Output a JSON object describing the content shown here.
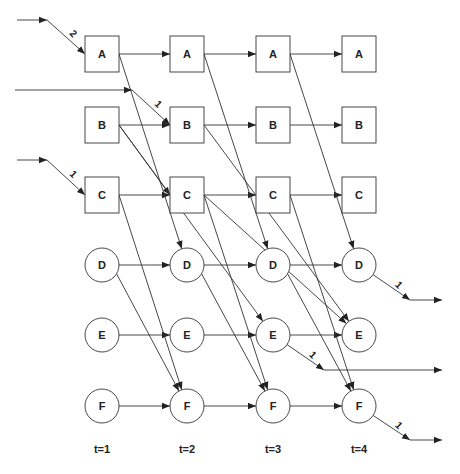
{
  "diagram": {
    "columns": [
      {
        "id": "t1",
        "label": "t=1",
        "x": 102
      },
      {
        "id": "t2",
        "label": "t=2",
        "x": 187
      },
      {
        "id": "t3",
        "label": "t=3",
        "x": 273
      },
      {
        "id": "t4",
        "label": "t=4",
        "x": 359
      }
    ],
    "rows": [
      {
        "id": "A",
        "label": "A",
        "shape": "square",
        "y": 54
      },
      {
        "id": "B",
        "label": "B",
        "shape": "square",
        "y": 125
      },
      {
        "id": "C",
        "label": "C",
        "shape": "square",
        "y": 195
      },
      {
        "id": "D",
        "label": "D",
        "shape": "circle",
        "y": 265
      },
      {
        "id": "E",
        "label": "E",
        "shape": "circle",
        "y": 335
      },
      {
        "id": "F",
        "label": "F",
        "shape": "circle",
        "y": 406
      }
    ],
    "edges": [
      {
        "from": [
          "A",
          0
        ],
        "to": [
          "A",
          1
        ]
      },
      {
        "from": [
          "A",
          1
        ],
        "to": [
          "A",
          2
        ]
      },
      {
        "from": [
          "A",
          2
        ],
        "to": [
          "A",
          3
        ]
      },
      {
        "from": [
          "B",
          0
        ],
        "to": [
          "B",
          1
        ]
      },
      {
        "from": [
          "B",
          1
        ],
        "to": [
          "B",
          2
        ]
      },
      {
        "from": [
          "B",
          2
        ],
        "to": [
          "B",
          3
        ]
      },
      {
        "from": [
          "C",
          0
        ],
        "to": [
          "C",
          1
        ]
      },
      {
        "from": [
          "C",
          1
        ],
        "to": [
          "C",
          2
        ]
      },
      {
        "from": [
          "C",
          2
        ],
        "to": [
          "C",
          3
        ]
      },
      {
        "from": [
          "D",
          0
        ],
        "to": [
          "D",
          1
        ]
      },
      {
        "from": [
          "D",
          1
        ],
        "to": [
          "D",
          2
        ]
      },
      {
        "from": [
          "D",
          2
        ],
        "to": [
          "D",
          3
        ]
      },
      {
        "from": [
          "E",
          0
        ],
        "to": [
          "E",
          1
        ]
      },
      {
        "from": [
          "E",
          1
        ],
        "to": [
          "E",
          2
        ]
      },
      {
        "from": [
          "E",
          2
        ],
        "to": [
          "E",
          3
        ]
      },
      {
        "from": [
          "F",
          0
        ],
        "to": [
          "F",
          1
        ]
      },
      {
        "from": [
          "F",
          1
        ],
        "to": [
          "F",
          2
        ]
      },
      {
        "from": [
          "F",
          2
        ],
        "to": [
          "F",
          3
        ]
      },
      {
        "from": [
          "A",
          0
        ],
        "to": [
          "D",
          1
        ]
      },
      {
        "from": [
          "A",
          1
        ],
        "to": [
          "D",
          2
        ]
      },
      {
        "from": [
          "A",
          2
        ],
        "to": [
          "D",
          3
        ]
      },
      {
        "from": [
          "B",
          0
        ],
        "to": [
          "C",
          1
        ]
      },
      {
        "from": [
          "B",
          0
        ],
        "to": [
          "E",
          2
        ]
      },
      {
        "from": [
          "B",
          1
        ],
        "to": [
          "E",
          3
        ]
      },
      {
        "from": [
          "C",
          0
        ],
        "to": [
          "F",
          1
        ]
      },
      {
        "from": [
          "C",
          1
        ],
        "to": [
          "F",
          2
        ]
      },
      {
        "from": [
          "C",
          2
        ],
        "to": [
          "F",
          3
        ]
      },
      {
        "from": [
          "D",
          0
        ],
        "to": [
          "F",
          1
        ]
      },
      {
        "from": [
          "D",
          1
        ],
        "to": [
          "F",
          2
        ]
      },
      {
        "from": [
          "D",
          2
        ],
        "to": [
          "F",
          3
        ]
      },
      {
        "from": [
          "C",
          1
        ],
        "to": [
          "E",
          3
        ]
      }
    ],
    "inputs": [
      {
        "label": "2",
        "start": [
          17,
          20
        ],
        "elbow": [
          47,
          20
        ],
        "target": [
          "A",
          0
        ]
      },
      {
        "label": "1",
        "start": [
          15,
          90
        ],
        "elbow": [
          132,
          90
        ],
        "target": [
          "B",
          1
        ]
      },
      {
        "label": "1",
        "start": [
          17,
          160
        ],
        "elbow": [
          47,
          160
        ],
        "target": [
          "C",
          0
        ]
      }
    ],
    "outputs": [
      {
        "label": "1",
        "source": [
          "D",
          3
        ],
        "elbow": [
          410,
          300
        ],
        "end": [
          442,
          300
        ]
      },
      {
        "label": "1",
        "source": [
          "E",
          2
        ],
        "elbow": [
          324,
          370
        ],
        "end": [
          442,
          370
        ]
      },
      {
        "label": "1",
        "source": [
          "F",
          3
        ],
        "elbow": [
          410,
          440
        ],
        "end": [
          442,
          440
        ]
      }
    ],
    "time_label_y": 453,
    "colors": {
      "stroke": "#333333",
      "text": "#222222",
      "background": "#ffffff"
    }
  }
}
